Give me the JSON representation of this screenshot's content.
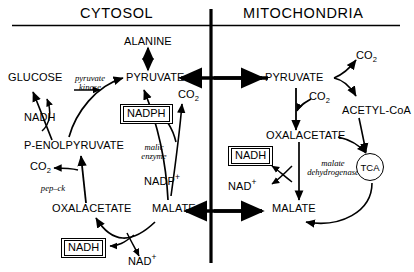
{
  "diagram": {
    "title_left": "CYTOSOL",
    "title_right": "MITOCHONDRIA",
    "compartments": [
      {
        "name": "cytosol",
        "label": "CYTOSOL"
      },
      {
        "name": "mitochondria",
        "label": "MITOCHONDRIA"
      }
    ],
    "cytosol": {
      "metabolites": {
        "alanine": "ALANINE",
        "glucose": "GLUCOSE",
        "pyruvate": "PYRUVATE",
        "co2_pyruvate": "CO",
        "co2_pyruvate_sub": "2",
        "nadh_glucose": "NADH",
        "pep": "P-ENOLPYRUVATE",
        "co2_pepck": "CO",
        "co2_pepck_sub": "2",
        "oxalacetate": "OXALACETATE",
        "malate": "MALATE",
        "nadp_plus": "NADP",
        "nadp_plus_sup": "+",
        "nad_plus": "NAD",
        "nad_plus_sup": "+"
      },
      "boxed": {
        "nadph": "NADPH",
        "nadh_bottom": "NADH"
      },
      "enzymes": {
        "pyruvate_kinase_line1": "pyruvate",
        "pyruvate_kinase_line2": "kinase",
        "malic_enzyme_line1": "malic",
        "malic_enzyme_line2": "enzyme",
        "pepck": "pep–ck"
      }
    },
    "mitochondria": {
      "metabolites": {
        "pyruvate": "PYRUVATE",
        "co2_top": "CO",
        "co2_top_sub": "2",
        "co2_carboxylase": "CO",
        "co2_carboxylase_sub": "2",
        "acetyl_coa": "ACETYL-CoA",
        "oxalacetate": "OXALACETATE",
        "malate": "MALATE",
        "nad_plus": "NAD",
        "nad_plus_sup": "+"
      },
      "boxed": {
        "nadh": "NADH"
      },
      "enzymes": {
        "malate_dehydrogenase_line1": "malate",
        "malate_dehydrogenase_line2": "dehydrogenase"
      },
      "cycle": {
        "tca": "TCA"
      }
    },
    "colors": {
      "stroke": "#000000",
      "background": "#ffffff"
    }
  }
}
